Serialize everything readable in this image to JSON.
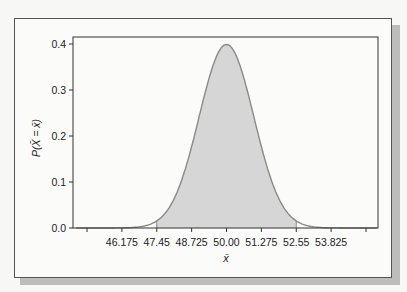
{
  "chart_data": {
    "type": "area",
    "title": "",
    "xlabel": "x̄",
    "ylabel": "P(X̄ = x̄)",
    "distribution": "normal",
    "mean": 50.0,
    "sd": 1.0,
    "shaded_range": [
      47.45,
      52.55
    ],
    "x_tick_labels": [
      "46.175",
      "47.45",
      "48.725",
      "50.00",
      "51.275",
      "52.55",
      "53.825"
    ],
    "x_ticks": [
      44.9,
      46.175,
      47.45,
      48.725,
      50.0,
      51.275,
      52.55,
      53.825,
      55.1
    ],
    "y_tick_labels": [
      "0.0",
      "0.1",
      "0.2",
      "0.3",
      "0.4"
    ],
    "ylim": [
      0,
      0.4
    ],
    "peak_value": 0.399,
    "grid": false,
    "legend": null,
    "colors": {
      "curve": "#8a8a8a",
      "fill": "#d6d6d6",
      "axis": "#333333"
    }
  }
}
